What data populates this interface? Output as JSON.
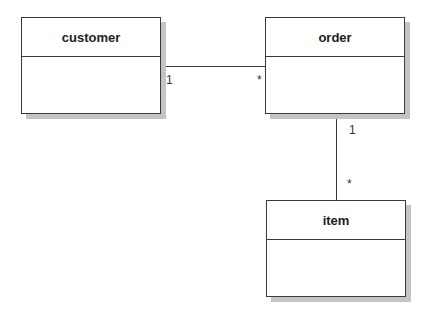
{
  "diagram": {
    "type": "uml-class-diagram",
    "classes": [
      {
        "id": "customer",
        "name": "customer"
      },
      {
        "id": "order",
        "name": "order"
      },
      {
        "id": "item",
        "name": "item"
      }
    ],
    "associations": [
      {
        "from": "customer",
        "to": "order",
        "from_multiplicity": "1",
        "to_multiplicity": "*"
      },
      {
        "from": "order",
        "to": "item",
        "from_multiplicity": "1",
        "to_multiplicity": "*"
      }
    ]
  }
}
